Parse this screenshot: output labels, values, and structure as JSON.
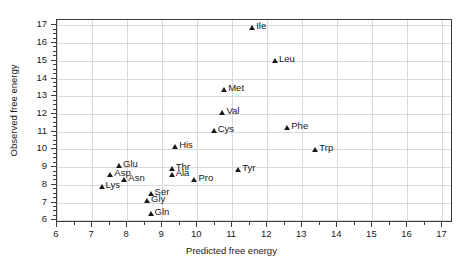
{
  "chart_data": {
    "type": "scatter",
    "title": "",
    "xlabel": "Predicted free energy",
    "ylabel": "Observed free energy",
    "xlim": [
      6,
      17.3
    ],
    "ylim": [
      5.85,
      17.3
    ],
    "xticks": [
      6,
      7,
      8,
      9,
      10,
      11,
      12,
      13,
      14,
      15,
      16,
      17
    ],
    "yticks": [
      6,
      7,
      8,
      9,
      10,
      11,
      12,
      13,
      14,
      15,
      16,
      17
    ],
    "grid": true,
    "legend": "none",
    "marker": "triangle",
    "marker_color": "#1a1a1a",
    "grid_color": "#d9d9d9",
    "axis_color": "#3c3c3c",
    "points": [
      {
        "label": "Ile",
        "x": 11.6,
        "y": 16.8
      },
      {
        "label": "Leu",
        "x": 12.25,
        "y": 14.95
      },
      {
        "label": "Met",
        "x": 10.8,
        "y": 13.3
      },
      {
        "label": "Val",
        "x": 10.75,
        "y": 12.0
      },
      {
        "label": "Phe",
        "x": 12.6,
        "y": 11.15
      },
      {
        "label": "Cys",
        "x": 10.5,
        "y": 11.0
      },
      {
        "label": "His",
        "x": 9.4,
        "y": 10.1
      },
      {
        "label": "Trp",
        "x": 13.4,
        "y": 9.9
      },
      {
        "label": "Glu",
        "x": 7.8,
        "y": 9.0
      },
      {
        "label": "Thr",
        "x": 9.3,
        "y": 8.85
      },
      {
        "label": "Tyr",
        "x": 11.2,
        "y": 8.8
      },
      {
        "label": "Asp",
        "x": 7.55,
        "y": 8.5
      },
      {
        "label": "Ala",
        "x": 9.3,
        "y": 8.5
      },
      {
        "label": "Asn",
        "x": 7.95,
        "y": 8.2
      },
      {
        "label": "Pro",
        "x": 9.95,
        "y": 8.2
      },
      {
        "label": "Lys",
        "x": 7.3,
        "y": 7.85
      },
      {
        "label": "Ser",
        "x": 8.7,
        "y": 7.45
      },
      {
        "label": "Gly",
        "x": 8.6,
        "y": 7.05
      },
      {
        "label": "Gln",
        "x": 8.7,
        "y": 6.3
      }
    ]
  }
}
